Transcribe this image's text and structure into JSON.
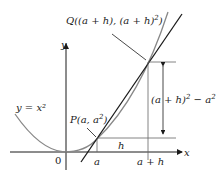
{
  "diagram": {
    "axes": {
      "x_label": "x",
      "y_label": "y",
      "origin_label": "0"
    },
    "curve_label": "y = x²",
    "point_p": {
      "label_main": "P(a, a",
      "sup": "2",
      "label_end": ")"
    },
    "point_q": {
      "label_main": "Q((a + h), (a + h)",
      "sup": "2",
      "label_end": ")"
    },
    "x_ticks": {
      "a": "a",
      "a_plus_h": "a + h"
    },
    "h_label": "h",
    "rise_label": {
      "main": "(a + h)",
      "sup": "2",
      "rest": " − a",
      "sup2": "2"
    },
    "colors": {
      "curve": "#888888",
      "secant": "#1a1a1a",
      "axes": "#1a1a1a",
      "guides": "#666666"
    }
  }
}
